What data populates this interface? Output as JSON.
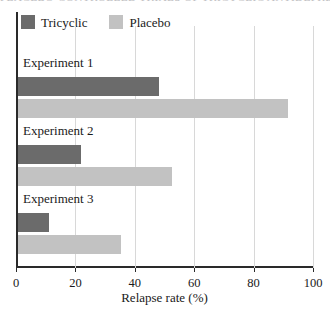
{
  "chart_data": {
    "type": "bar",
    "orientation": "horizontal",
    "title": "PLACEBO-CONTROLLED TRIALS OF TRICYCLIC ANTIDEPRESSANTS",
    "xlabel": "Relapse rate (%)",
    "ylabel": "",
    "xlim": [
      0,
      100
    ],
    "xticks": [
      0,
      20,
      40,
      60,
      80,
      100
    ],
    "xtick_labels": [
      "0",
      "20",
      "40",
      "60",
      "80",
      "100"
    ],
    "grid": "vertical",
    "legend_position": "top-left",
    "categories": [
      "Experiment 1",
      "Experiment 2",
      "Experiment 3"
    ],
    "series": [
      {
        "name": "Tricyclic",
        "color": "#6b6b6b",
        "values": [
          48,
          22,
          11
        ]
      },
      {
        "name": "Placebo",
        "color": "#c2c2c2",
        "values": [
          91.5,
          52.5,
          35.5
        ]
      }
    ]
  },
  "axis": {
    "line_color": "#2a2a2a",
    "grid_color": "#d8d8d8"
  }
}
